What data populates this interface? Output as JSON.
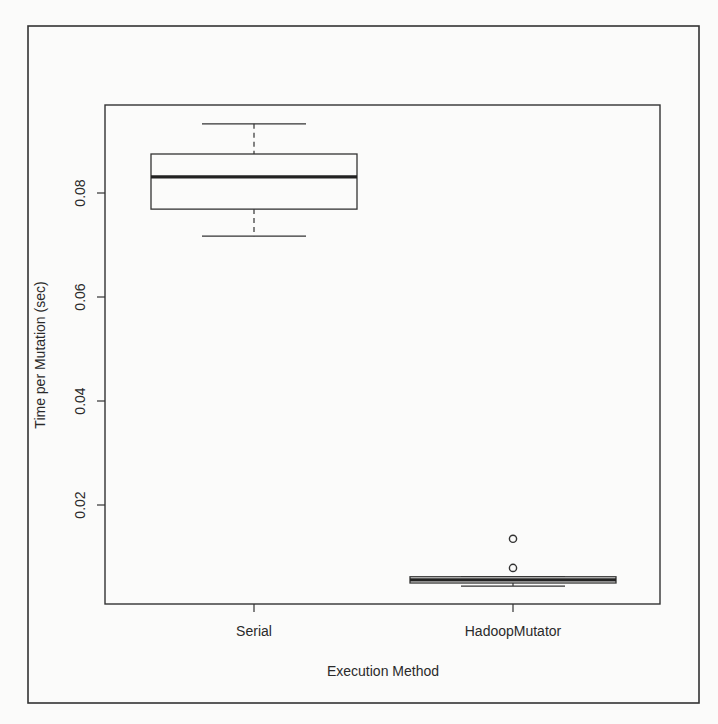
{
  "chart_data": {
    "type": "boxplot",
    "title": "",
    "xlabel": "Execution Method",
    "ylabel": "Time per Mutation (sec)",
    "categories": [
      "Serial",
      "HadoopMutator"
    ],
    "yticks": [
      0.02,
      0.04,
      0.06,
      0.08
    ],
    "ytick_labels": [
      "0.02",
      "0.04",
      "0.06",
      "0.08"
    ],
    "ylim": [
      0.0,
      0.095
    ],
    "grid": false,
    "legend": null,
    "series": [
      {
        "name": "Serial",
        "whisker_low": 0.0717,
        "q1": 0.0769,
        "median": 0.0831,
        "q3": 0.0875,
        "whisker_high": 0.0933,
        "outliers": []
      },
      {
        "name": "HadoopMutator",
        "whisker_low": 0.0044,
        "q1": 0.005,
        "median": 0.0056,
        "q3": 0.0062,
        "whisker_high": 0.0062,
        "outliers": [
          0.0079,
          0.0135
        ]
      }
    ]
  }
}
